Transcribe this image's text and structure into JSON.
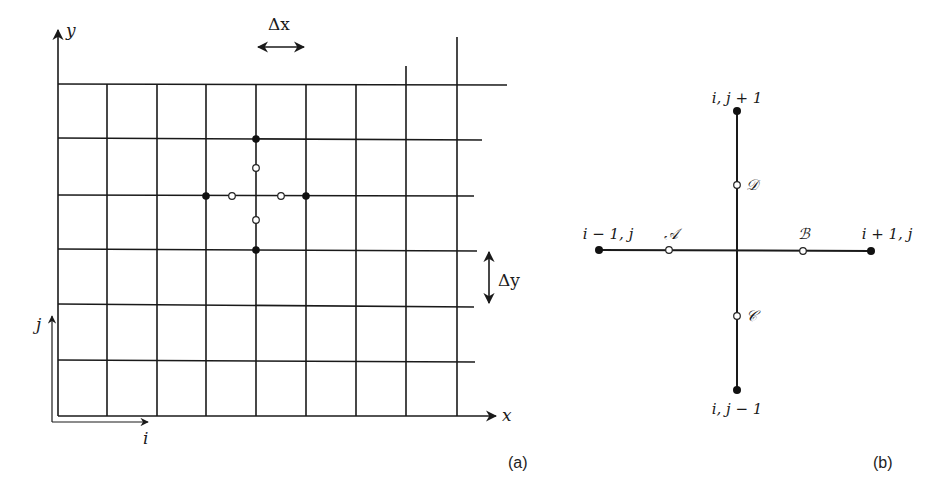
{
  "panel_a": {
    "caption": "(a)",
    "axis_x_label": "x",
    "axis_y_label": "y",
    "index_i_label": "i",
    "index_j_label": "j",
    "dx_label": "Δx",
    "dy_label": "Δy",
    "grid": {
      "vertical_lines_x": [
        58,
        107,
        157,
        206,
        256,
        306,
        356,
        406,
        457
      ],
      "horizontal_lines_y": [
        84,
        139,
        196,
        249,
        305,
        360,
        416
      ]
    },
    "stencil": {
      "center": "i, j",
      "filled_nodes": 4,
      "open_midpoints": 4
    }
  },
  "panel_b": {
    "caption": "(b)",
    "nodes": {
      "top": "i, j + 1",
      "bottom": "i, j − 1",
      "left": "i − 1, j",
      "right": "i + 1, j"
    },
    "midpoints": {
      "A": "𝒜",
      "B": "ℬ",
      "C": "𝒞",
      "D": "𝒟"
    }
  }
}
